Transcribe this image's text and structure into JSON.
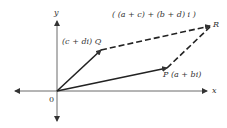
{
  "diagram": {
    "axes": {
      "x_label": "x",
      "y_label": "y",
      "origin_label": "0"
    },
    "points": [
      {
        "name": "Q",
        "label": "(c + di) Q",
        "x": 101,
        "y": 50
      },
      {
        "name": "P",
        "label": "P (a + bi)",
        "x": 167,
        "y": 68
      },
      {
        "name": "R",
        "label": "R",
        "x": 211,
        "y": 26
      }
    ],
    "sum_label": "( (a + c) + (b + d) i )",
    "colors": {
      "line": "#222222",
      "axis": "#444444",
      "text": "#333333"
    }
  }
}
